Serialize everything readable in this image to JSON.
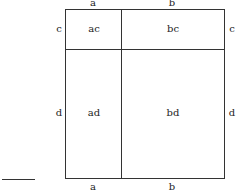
{
  "diagram": {
    "top_labels": {
      "left": "a",
      "right": "b"
    },
    "bottom_labels": {
      "left": "a",
      "right": "b"
    },
    "left_labels": {
      "top": "c",
      "bottom": "d"
    },
    "right_labels": {
      "top": "c",
      "bottom": "d"
    },
    "cells": {
      "ac": "ac",
      "bc": "bc",
      "ad": "ad",
      "bd": "bd"
    }
  }
}
